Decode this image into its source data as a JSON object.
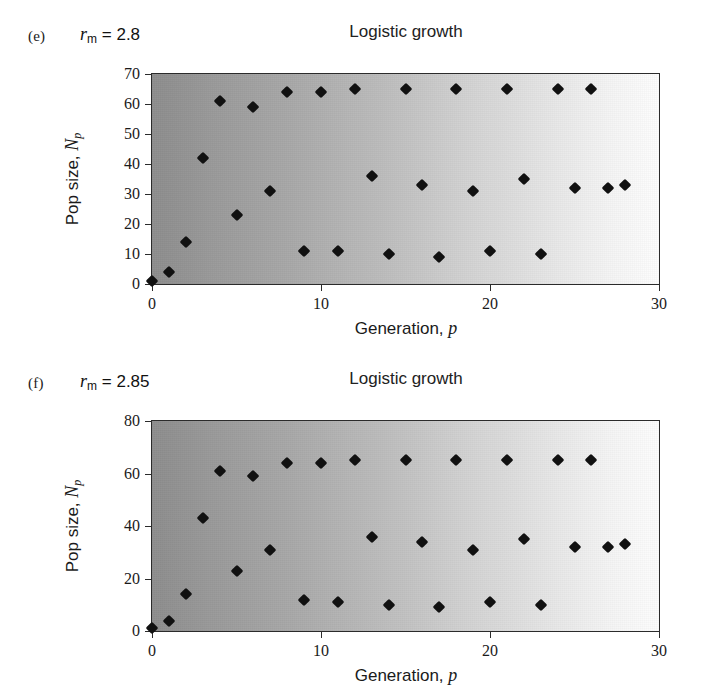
{
  "figure": {
    "background_color": "#ffffff",
    "marker_color": "#111111",
    "axis_color": "#2b2b2b",
    "gradient_left": "#8d8d8d",
    "gradient_right": "#fdfdfd"
  },
  "panels": [
    {
      "tag": "(e)",
      "param_symbol": "r",
      "param_subscript": "m",
      "param_equals": "=",
      "param_value": "2.8",
      "param_text": "r_m = 2.8"
    },
    {
      "tag": "(f)",
      "param_symbol": "r",
      "param_subscript": "m",
      "param_equals": "=",
      "param_value": "2.85",
      "param_text": "r_m = 2.85"
    }
  ],
  "chart_data": [
    {
      "type": "scatter",
      "title": "Logistic growth",
      "panel_tag": "(e)",
      "annotation": "r_m = 2.8",
      "xlabel": "Generation, p",
      "ylabel": "Pop size, N_p",
      "xlim": [
        0,
        30
      ],
      "ylim": [
        0,
        70
      ],
      "xticks": [
        0,
        10,
        20,
        30
      ],
      "yticks": [
        0,
        10,
        20,
        30,
        40,
        50,
        60,
        70
      ],
      "grid": false,
      "legend": null,
      "marker": "diamond",
      "x": [
        0,
        1,
        2,
        3,
        4,
        5,
        6,
        7,
        8,
        9,
        10,
        11,
        12,
        13,
        14,
        15,
        16,
        17,
        18,
        19,
        20,
        21,
        22,
        23,
        24,
        25,
        26,
        27,
        28
      ],
      "y": [
        1,
        4,
        14,
        42,
        61,
        23,
        59,
        31,
        64,
        11,
        64,
        11,
        65,
        36,
        10,
        65,
        33,
        9,
        65,
        31,
        11,
        65,
        35,
        10,
        65,
        32,
        65,
        32,
        33
      ]
    },
    {
      "type": "scatter",
      "title": "Logistic growth",
      "panel_tag": "(f)",
      "annotation": "r_m = 2.85",
      "xlabel": "Generation, p",
      "ylabel": "Pop size, N_p",
      "xlim": [
        0,
        30
      ],
      "ylim": [
        0,
        80
      ],
      "xticks": [
        0,
        10,
        20,
        30
      ],
      "yticks": [
        0,
        20,
        40,
        60,
        80
      ],
      "grid": false,
      "legend": null,
      "marker": "diamond",
      "x": [
        0,
        1,
        2,
        3,
        4,
        5,
        6,
        7,
        8,
        9,
        10,
        11,
        12,
        13,
        14,
        15,
        16,
        17,
        18,
        19,
        20,
        21,
        22,
        23,
        24,
        25,
        26,
        27,
        28
      ],
      "y": [
        1,
        4,
        14,
        43,
        61,
        23,
        59,
        31,
        64,
        12,
        64,
        11,
        65,
        36,
        10,
        65,
        34,
        9,
        65,
        31,
        11,
        65,
        35,
        10,
        65,
        32,
        65,
        32,
        33
      ]
    }
  ]
}
